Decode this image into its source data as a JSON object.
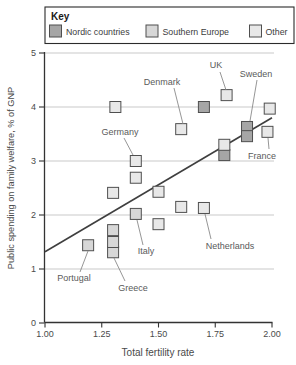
{
  "key": {
    "title": "Key",
    "items": [
      {
        "label": "Nordic countries",
        "group": "nordic",
        "fill": "#a6a6a6"
      },
      {
        "label": "Southern Europe",
        "group": "southern",
        "fill": "#d7d7d7"
      },
      {
        "label": "Other",
        "group": "other",
        "fill": "#e8e8e8"
      }
    ]
  },
  "chart_data": {
    "type": "scatter",
    "title": "",
    "xlabel": "Total fertility rate",
    "ylabel": "Public spending on family welfare, % of GNP",
    "xlim": [
      1.0,
      2.0
    ],
    "ylim": [
      0,
      5
    ],
    "grid": true,
    "legend_position": "top",
    "x_ticks": [
      {
        "v": 1.0,
        "label": "1.00"
      },
      {
        "v": 1.25,
        "label": "1.25"
      },
      {
        "v": 1.5,
        "label": "1.50"
      },
      {
        "v": 1.75,
        "label": "1.75"
      },
      {
        "v": 2.0,
        "label": "2.00"
      }
    ],
    "y_ticks": [
      {
        "v": 0,
        "label": "0"
      },
      {
        "v": 1,
        "label": "1"
      },
      {
        "v": 2,
        "label": "2"
      },
      {
        "v": 3,
        "label": "3"
      },
      {
        "v": 4,
        "label": "4"
      },
      {
        "v": 5,
        "label": "5"
      }
    ],
    "series": [
      {
        "name": "Nordic countries",
        "group": "nordic",
        "points": [
          {
            "x": 1.7,
            "y": 4.0
          },
          {
            "x": 1.89,
            "y": 3.63,
            "label": "Sweden"
          },
          {
            "x": 1.89,
            "y": 3.46
          },
          {
            "x": 1.79,
            "y": 3.11
          }
        ]
      },
      {
        "name": "Southern Europe",
        "group": "southern",
        "points": [
          {
            "x": 1.19,
            "y": 1.44,
            "label": "Portugal"
          },
          {
            "x": 1.3,
            "y": 1.31,
            "label": "Greece"
          },
          {
            "x": 1.3,
            "y": 1.5
          },
          {
            "x": 1.3,
            "y": 1.72
          },
          {
            "x": 1.4,
            "y": 2.02,
            "label": "Italy"
          }
        ]
      },
      {
        "name": "Other",
        "group": "other",
        "points": [
          {
            "x": 1.31,
            "y": 4.0
          },
          {
            "x": 1.8,
            "y": 4.22,
            "label": "UK"
          },
          {
            "x": 1.99,
            "y": 3.97
          },
          {
            "x": 1.6,
            "y": 3.59,
            "label": "Denmark"
          },
          {
            "x": 1.98,
            "y": 3.54,
            "label": "France"
          },
          {
            "x": 1.79,
            "y": 3.3
          },
          {
            "x": 1.4,
            "y": 3.0,
            "label": "Germany"
          },
          {
            "x": 1.4,
            "y": 2.69
          },
          {
            "x": 1.3,
            "y": 2.41
          },
          {
            "x": 1.5,
            "y": 2.43
          },
          {
            "x": 1.6,
            "y": 2.15
          },
          {
            "x": 1.7,
            "y": 2.13,
            "label": "Netherlands"
          },
          {
            "x": 1.5,
            "y": 1.83
          }
        ]
      }
    ],
    "trend_line": {
      "x1": 1.0,
      "y1": 1.32,
      "x2": 2.0,
      "y2": 3.8
    },
    "annotations": [
      {
        "label": "Denmark",
        "text_px": [
          162,
          85
        ],
        "line_px": [
          174,
          88,
          183,
          124
        ]
      },
      {
        "label": "UK",
        "text_px": [
          216,
          68
        ],
        "line_px": [
          220,
          72,
          226,
          90
        ]
      },
      {
        "label": "Sweden",
        "text_px": [
          256,
          77
        ],
        "line_px": [
          257,
          80,
          250,
          121
        ]
      },
      {
        "label": "France",
        "text_px": [
          262,
          159
        ],
        "line_px": [
          269,
          149,
          268,
          138
        ]
      },
      {
        "label": "Germany",
        "text_px": [
          120,
          135
        ],
        "line_px": [
          124,
          138,
          133,
          155
        ]
      },
      {
        "label": "Italy",
        "text_px": [
          146,
          254
        ],
        "line_px": [
          143,
          245,
          137,
          220
        ]
      },
      {
        "label": "Netherlands",
        "text_px": [
          230,
          249
        ],
        "line_px": [
          211,
          239,
          205,
          214
        ]
      },
      {
        "label": "Portugal",
        "text_px": [
          74,
          281
        ],
        "line_px": [
          80,
          272,
          88,
          251
        ]
      },
      {
        "label": "Greece",
        "text_px": [
          133,
          291
        ],
        "line_px": [
          125,
          281,
          114,
          258
        ]
      }
    ]
  },
  "colors": {
    "axis": "#333333",
    "grid": "#c9c9c9",
    "marker_stroke": "#4f4f4f",
    "trend": "#3f3f3f",
    "callout": "#8a8a8a",
    "key_box_border": "#2b2b2b"
  }
}
